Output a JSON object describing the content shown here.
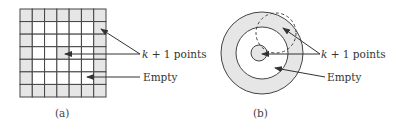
{
  "panels": [
    {
      "id": "a",
      "caption": "(a)",
      "grid": {
        "rows": 7,
        "cols": 7,
        "shaded_cells": "border cells plus center cell (row 3, col 3)"
      },
      "labels": {
        "points": "k + 1 points",
        "points_k": "k",
        "points_rest": " + 1 points",
        "empty": "Empty"
      }
    },
    {
      "id": "b",
      "caption": "(b)",
      "shapes": [
        "outer shaded annulus",
        "inner white disk",
        "small central circle",
        "dashed circle"
      ],
      "labels": {
        "points": "k + 1 points",
        "points_k": "k",
        "points_rest": " + 1 points",
        "empty": "Empty"
      }
    }
  ],
  "colors": {
    "shade": "#e6e6e6",
    "line": "#444444",
    "text": "#333333"
  }
}
